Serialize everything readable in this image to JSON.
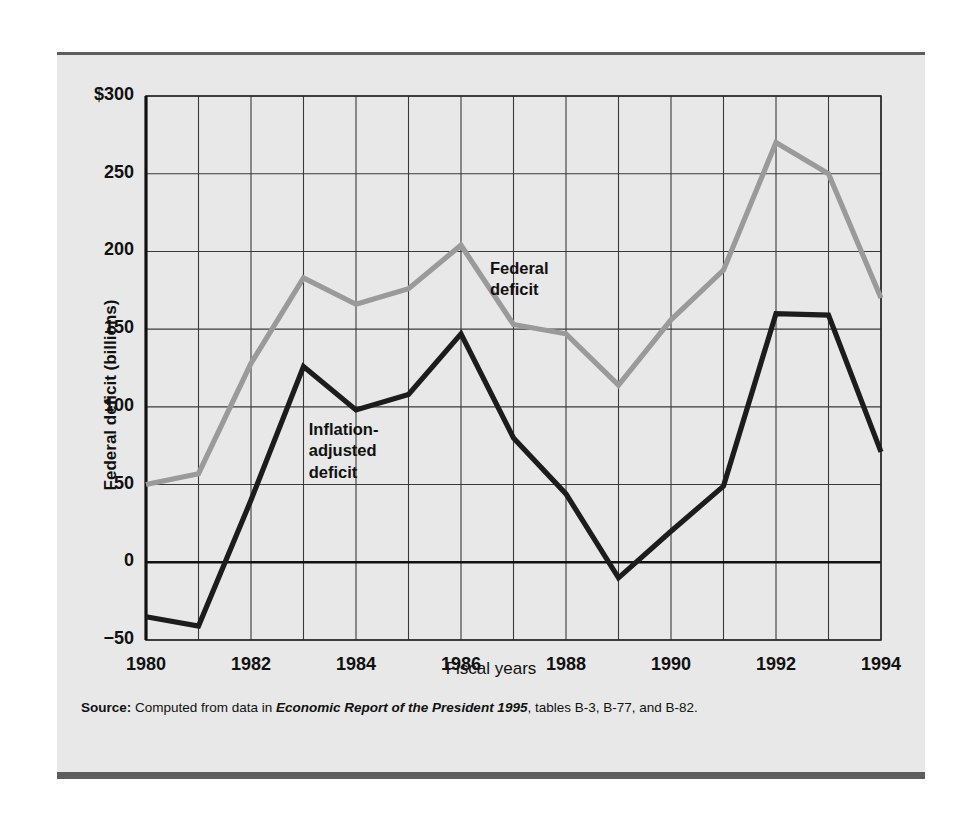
{
  "figure": {
    "background": "#e8e8e8",
    "rule_color": "#5d5d5d"
  },
  "axes": {
    "y_title": "Federal deficit (billions)",
    "x_title": "Fiscal years",
    "y_ticks": [
      "$300",
      "250",
      "200",
      "150",
      "100",
      "50",
      "0",
      "−50"
    ],
    "x_ticks": [
      "1980",
      "1982",
      "1984",
      "1986",
      "1988",
      "1990",
      "1992",
      "1994"
    ]
  },
  "labels": {
    "federal_deficit": "Federal\ndeficit",
    "inflation_adjusted": "Inflation-\nadjusted\ndeficit"
  },
  "source": {
    "prefix": "Source:",
    "text_before": " Computed from data in ",
    "italic": "Economic Report of the President 1995",
    "text_after": ", tables B-3, B-77, and B-82."
  },
  "chart_data": {
    "type": "line",
    "title": "",
    "xlabel": "Fiscal years",
    "ylabel": "Federal deficit (billions)",
    "xlim": [
      1980,
      1994
    ],
    "ylim": [
      -50,
      300
    ],
    "ytick_values": [
      300,
      250,
      200,
      150,
      100,
      50,
      0,
      -50
    ],
    "xtick_values": [
      1980,
      1982,
      1984,
      1986,
      1988,
      1990,
      1992,
      1994
    ],
    "grid": true,
    "legend": "inline-annotations",
    "x": [
      1980,
      1981,
      1982,
      1983,
      1984,
      1985,
      1986,
      1987,
      1988,
      1989,
      1990,
      1991,
      1992,
      1993,
      1994
    ],
    "series": [
      {
        "name": "Federal deficit",
        "color": "#9a9a9a",
        "values": [
          50,
          57,
          128,
          183,
          166,
          176,
          204,
          153,
          147,
          114,
          156,
          188,
          270,
          250,
          170
        ]
      },
      {
        "name": "Inflation-adjusted deficit",
        "color": "#1c1c1c",
        "values": [
          -35,
          -41,
          40,
          126,
          98,
          108,
          147,
          80,
          44,
          -10,
          20,
          49,
          160,
          159,
          71
        ]
      }
    ]
  }
}
